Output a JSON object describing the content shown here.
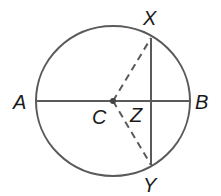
{
  "diagram": {
    "type": "geometry-circle",
    "stroke_color": "#5a5a5a",
    "label_color": "#1a1a1a",
    "circle": {
      "cx": 113,
      "cy": 101,
      "rx": 77,
      "ry": 75
    },
    "points": {
      "A": {
        "label": "A",
        "x": 36,
        "y": 101
      },
      "B": {
        "label": "B",
        "x": 190,
        "y": 101
      },
      "C": {
        "label": "C",
        "x": 113,
        "y": 101
      },
      "X": {
        "label": "X",
        "x": 151,
        "y": 38
      },
      "Y": {
        "label": "Y",
        "x": 151,
        "y": 165
      },
      "Z": {
        "label": "Z",
        "x": 151,
        "y": 101
      }
    },
    "segments": [
      {
        "from": "A",
        "to": "B",
        "style": "solid",
        "role": "diameter"
      },
      {
        "from": "X",
        "to": "Y",
        "style": "solid",
        "role": "chord"
      },
      {
        "from": "C",
        "to": "X",
        "style": "dashed",
        "role": "radius"
      },
      {
        "from": "C",
        "to": "Y",
        "style": "dashed",
        "role": "radius"
      }
    ],
    "labels": {
      "A": "A",
      "B": "B",
      "C": "C",
      "X": "X",
      "Y": "Y",
      "Z": "Z"
    }
  }
}
